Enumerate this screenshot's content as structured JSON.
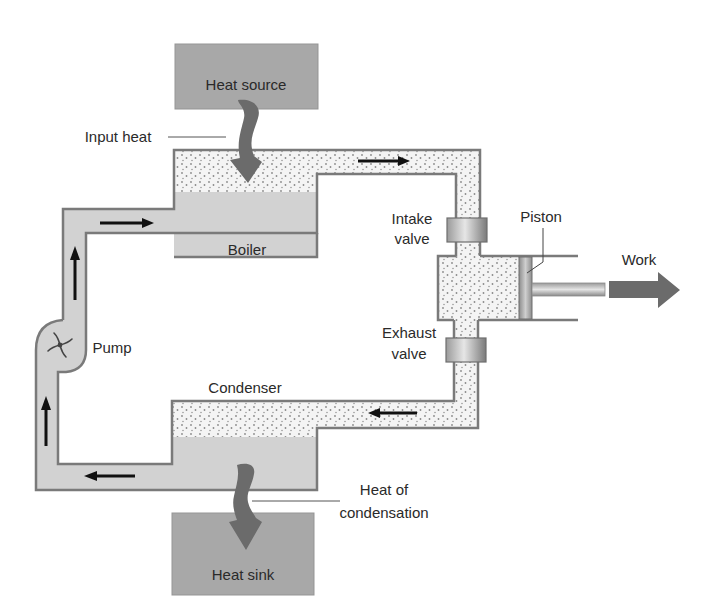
{
  "diagram": {
    "labels": {
      "heat_source": "Heat source",
      "input_heat": "Input heat",
      "boiler": "Boiler",
      "intake_valve_1": "Intake",
      "intake_valve_2": "valve",
      "piston": "Piston",
      "work": "Work",
      "exhaust_valve_1": "Exhaust",
      "exhaust_valve_2": "valve",
      "pump": "Pump",
      "condenser": "Condenser",
      "heat_of_condensation_1": "Heat of",
      "heat_of_condensation_2": "condensation",
      "heat_sink": "Heat sink"
    },
    "colors": {
      "heat_box": "#a8a8a8",
      "heat_arrow": "#6b6b6b",
      "liquid": "#d2d2d2",
      "pipe_outline": "#7a7a7a",
      "vapor_bg": "#f4f4f4",
      "vapor_dots": "#8a8a8a",
      "flow_arrow": "#111111"
    },
    "flow_direction": [
      "boiler",
      "intake-valve",
      "cylinder",
      "exhaust-valve",
      "condenser",
      "pump",
      "boiler"
    ]
  }
}
